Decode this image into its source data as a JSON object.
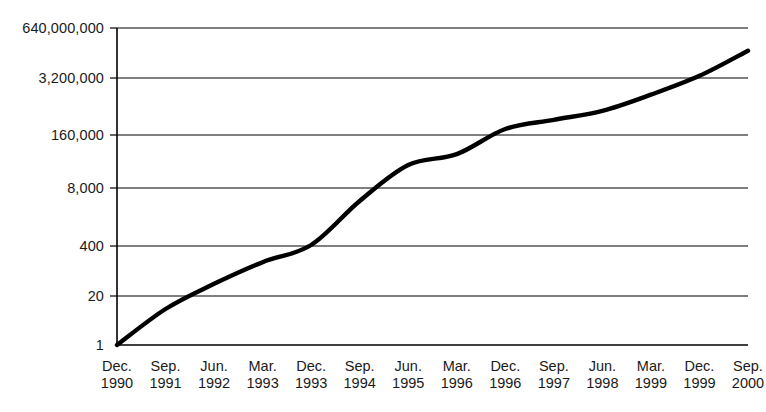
{
  "chart_data": {
    "type": "line",
    "title": "",
    "subtitle": "",
    "xlabel": "",
    "ylabel": "",
    "grid": true,
    "legend": false,
    "y_scale": "log",
    "y_log_base": 20,
    "ylim": [
      1,
      640000000
    ],
    "y_ticks": [
      1,
      20,
      400,
      8000,
      160000,
      3200000,
      640000000
    ],
    "y_tick_labels": [
      "1",
      "20",
      "400",
      "8,000",
      "160,000",
      "3,200,000",
      "640,000,000"
    ],
    "x_ticks": [
      "Dec. 1990",
      "Sep. 1991",
      "Jun. 1992",
      "Mar. 1993",
      "Dec. 1993",
      "Sep. 1994",
      "Jun. 1995",
      "Mar. 1996",
      "Dec. 1996",
      "Sep. 1997",
      "Jun. 1998",
      "Mar. 1999",
      "Dec. 1999",
      "Sep. 2000"
    ],
    "x_tick_months": [
      "Dec.",
      "Sep.",
      "Jun.",
      "Mar.",
      "Dec.",
      "Sep.",
      "Jun.",
      "Mar.",
      "Dec.",
      "Sep.",
      "Jun.",
      "Mar.",
      "Dec.",
      "Sep."
    ],
    "x_tick_years": [
      "1990",
      "1991",
      "1992",
      "1993",
      "1993",
      "1994",
      "1995",
      "1996",
      "1996",
      "1997",
      "1998",
      "1999",
      "1999",
      "2000"
    ],
    "series": [
      {
        "name": "count",
        "color": "#000000",
        "x": [
          "Dec. 1990",
          "Sep. 1991",
          "Jun. 1992",
          "Mar. 1993",
          "Dec. 1993",
          "Sep. 1994",
          "Jun. 1995",
          "Mar. 1996",
          "Dec. 1996",
          "Sep. 1997",
          "Jun. 1998",
          "Mar. 1999",
          "Dec. 1999",
          "Sep. 2000"
        ],
        "values": [
          1,
          10,
          50,
          200,
          600,
          10000,
          100000,
          200000,
          1000000,
          1800000,
          3200000,
          9000000,
          30000000,
          150000000
        ]
      }
    ]
  }
}
